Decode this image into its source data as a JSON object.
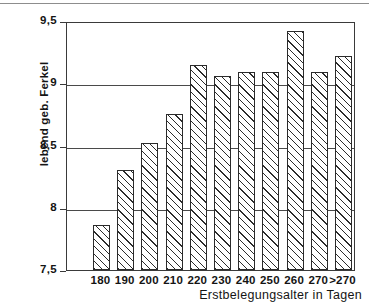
{
  "chart_data": {
    "type": "bar",
    "title": "",
    "subtitle": "",
    "xlabel": "Erstbelegungsalter in Tagen",
    "ylabel": "lebend geb. Ferkel",
    "categories": [
      "180",
      "190",
      "200",
      "210",
      "220",
      "230",
      "240",
      "250",
      "260",
      "270",
      ">270"
    ],
    "values": [
      7.86,
      8.3,
      8.52,
      8.75,
      9.15,
      9.06,
      9.09,
      9.09,
      9.42,
      9.09,
      9.22
    ],
    "ylim": [
      7.5,
      9.5
    ],
    "yticks": [
      "7,5",
      "8",
      "8,5",
      "9",
      "9,5"
    ],
    "ytick_values": [
      7.5,
      8,
      8.5,
      9,
      9.5
    ],
    "grid": "horizontal",
    "legend": "none",
    "bar_fill": "diagonal-hatch",
    "bar_edge_color": "#2b2b2b",
    "axis_color": "#3a3a3a",
    "background": "#ffffff"
  }
}
